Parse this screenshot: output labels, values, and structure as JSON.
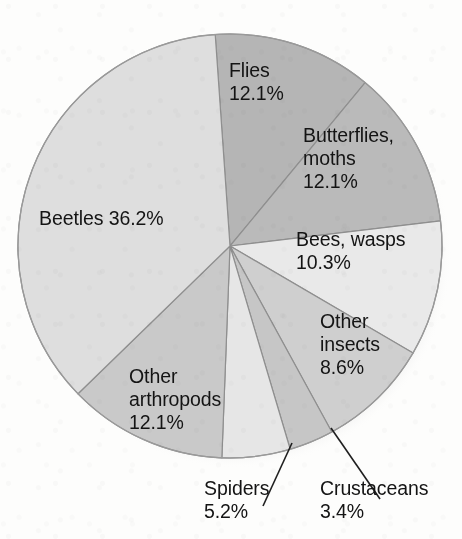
{
  "chart_data": {
    "type": "pie",
    "title": "",
    "subtitle": "",
    "xlabel": "",
    "ylabel": "",
    "legend_position": "none",
    "grid": false,
    "units": "percent",
    "total": 100.0,
    "categories": [
      "Flies",
      "Butterflies, moths",
      "Bees, wasps",
      "Other insects",
      "Crustaceans",
      "Spiders",
      "Other arthropods",
      "Beetles"
    ],
    "values": [
      12.1,
      12.1,
      10.3,
      8.6,
      3.4,
      5.2,
      12.1,
      36.2
    ],
    "slices": [
      {
        "name": "flies",
        "label": "Flies",
        "value": 12.1,
        "value_text": "12.1%",
        "display_text": "Flies\n12.1%",
        "color": "#b5b5b5",
        "label_placement": "inside",
        "start_angle": 356.0,
        "end_angle": 39.6
      },
      {
        "name": "butterflies-moths",
        "label": "Butterflies, moths",
        "value": 12.1,
        "value_text": "12.1%",
        "display_text": "Butterflies,\nmoths\n12.1%",
        "color": "#bababa",
        "label_placement": "inside",
        "start_angle": 39.6,
        "end_angle": 83.2
      },
      {
        "name": "bees-wasps",
        "label": "Bees, wasps",
        "value": 10.3,
        "value_text": "10.3%",
        "display_text": "Bees, wasps\n10.3%",
        "color": "#e9e9e9",
        "label_placement": "inside",
        "start_angle": 83.2,
        "end_angle": 120.3
      },
      {
        "name": "other-insects",
        "label": "Other insects",
        "value": 8.6,
        "value_text": "8.6%",
        "display_text": "Other\ninsects\n8.6%",
        "color": "#cfcfcf",
        "label_placement": "inside",
        "start_angle": 120.3,
        "end_angle": 151.3
      },
      {
        "name": "crustaceans",
        "label": "Crustaceans",
        "value": 3.4,
        "value_text": "3.4%",
        "display_text": "Crustaceans\n3.4%",
        "color": "#c6c6c6",
        "label_placement": "outside-callout",
        "start_angle": 151.3,
        "end_angle": 163.5
      },
      {
        "name": "spiders",
        "label": "Spiders",
        "value": 5.2,
        "value_text": "5.2%",
        "display_text": "Spiders\n5.2%",
        "color": "#e6e6e6",
        "label_placement": "outside-callout",
        "start_angle": 163.5,
        "end_angle": 182.2
      },
      {
        "name": "other-arthropods",
        "label": "Other arthropods",
        "value": 12.1,
        "value_text": "12.1%",
        "display_text": "Other\narthropods\n12.1%",
        "color": "#c9c9c9",
        "label_placement": "inside",
        "start_angle": 182.2,
        "end_angle": 225.8
      },
      {
        "name": "beetles",
        "label": "Beetles",
        "value": 36.2,
        "value_text": "36.2%",
        "display_text": "Beetles 36.2%",
        "color": "#dedede",
        "label_placement": "inside",
        "start_angle": 225.8,
        "end_angle": 356.0
      }
    ],
    "callouts": [
      {
        "name": "spiders",
        "text": "Spiders\n5.2%"
      },
      {
        "name": "crustaceans",
        "text": "Crustaceans\n3.4%"
      }
    ]
  },
  "geometry": {
    "center_x": 230,
    "center_y": 246,
    "radius": 212,
    "outline_color": "#8f8f8f",
    "shadow_color": "#d8d8d8"
  }
}
